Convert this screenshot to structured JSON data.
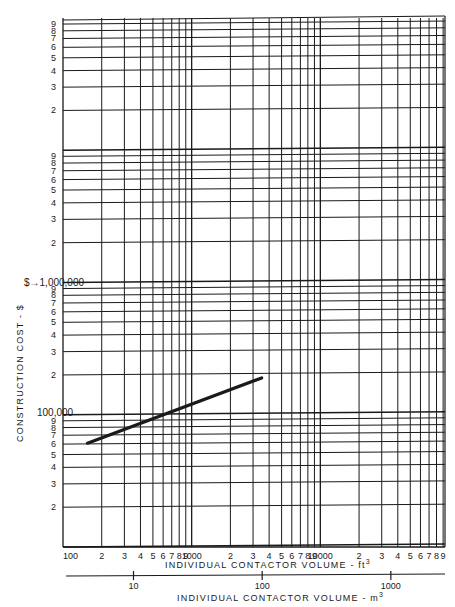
{
  "chart_data": {
    "type": "line",
    "title": "",
    "scale": {
      "x": "log",
      "y": "log"
    },
    "xlabel": "INDIVIDUAL CONTACTOR VOLUME - ft3",
    "xlabel_secondary": "INDIVIDUAL CONTACTOR VOLUME - m3",
    "ylabel": "CONSTRUCTION COST - $",
    "xlim": [
      100,
      100000
    ],
    "ylim": [
      10000,
      100000000
    ],
    "grid": true,
    "x_tick_labels": [
      "100",
      "2",
      "3",
      "4",
      "5",
      "6",
      "7",
      "8",
      "9",
      "1000",
      "2",
      "3",
      "4",
      "5",
      "6",
      "7",
      "8",
      "9",
      "10000",
      "2",
      "3",
      "4",
      "5",
      "6",
      "7",
      "8",
      "9"
    ],
    "x_secondary_ticks": [
      {
        "value": 10,
        "label": "10"
      },
      {
        "value": 100,
        "label": "100"
      },
      {
        "value": 1000,
        "label": "1000"
      }
    ],
    "y_tick_labels": {
      "decade_10k_100k": [
        "2",
        "3",
        "4",
        "5",
        "6",
        "7",
        "8",
        "9",
        "100,000"
      ],
      "decade_100k_1M": [
        "2",
        "3",
        "4",
        "5",
        "6",
        "7",
        "8",
        "9",
        "1,000,000"
      ],
      "decade_1M_10M": [
        "2",
        "3",
        "4",
        "5",
        "6",
        "7",
        "8",
        "9"
      ],
      "decade_10M_100M": [
        "2",
        "3",
        "4",
        "5",
        "6",
        "7",
        "8",
        "9"
      ]
    },
    "series": [
      {
        "name": "Construction cost",
        "x": [
          155,
          3500
        ],
        "y": [
          61000,
          190000
        ]
      }
    ]
  },
  "labels": {
    "y_axis_title": "CONSTRUCTION COST - $",
    "y_million": "1,000,000",
    "y_hundred_thousand": "100,000",
    "x_axis_title_ft": "INDIVIDUAL CONTACTOR VOLUME - ft",
    "x_axis_title_ft_sup": "3",
    "x_axis_title_m": "INDIVIDUAL CONTACTOR VOLUME - m",
    "x_axis_title_m_sup": "3"
  },
  "colors": {
    "ink": "#1a1a1a",
    "background": "#ffffff"
  }
}
